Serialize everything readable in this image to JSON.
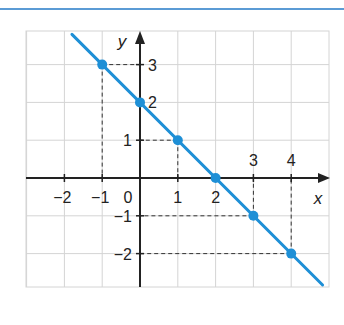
{
  "chart_data": {
    "type": "line",
    "title": "",
    "xlabel": "x",
    "ylabel": "y",
    "xlim": [
      -3,
      5
    ],
    "ylim": [
      -2.9,
      3.9
    ],
    "grid": true,
    "x_tick_labels": [
      "-2",
      "-1",
      "0",
      "1",
      "2",
      "3",
      "4"
    ],
    "y_tick_labels": [
      "3",
      "2",
      "1",
      "-1",
      "-2"
    ],
    "series": [
      {
        "name": "y = -x + 2",
        "color": "#1e8fd6",
        "points": [
          {
            "x": -1,
            "y": 3
          },
          {
            "x": 0,
            "y": 2
          },
          {
            "x": 1,
            "y": 1
          },
          {
            "x": 2,
            "y": 0
          },
          {
            "x": 3,
            "y": -1
          },
          {
            "x": 4,
            "y": -2
          }
        ]
      }
    ],
    "annotations": [
      "dashed projection lines from each point to the axes"
    ]
  },
  "colors": {
    "line": "#1e8fd6",
    "rule": "#5b9bd5",
    "grid": "#d4d4d4",
    "axis": "#222222"
  }
}
